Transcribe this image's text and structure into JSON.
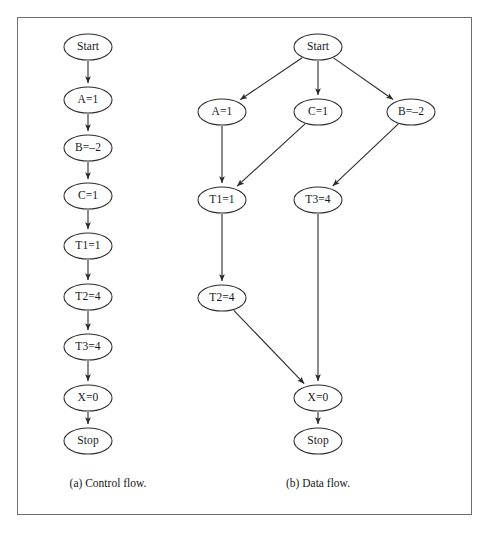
{
  "figure": {
    "frame": {
      "x": 17,
      "y": 17,
      "width": 455,
      "height": 498,
      "border_color": "#6f6f6f"
    },
    "ink_color": "#2b2b2b",
    "node_fill": "#ffffff",
    "text_color": "#15171a",
    "node_rx": 24,
    "node_ry": 13
  },
  "panels": [
    {
      "id": "control-flow",
      "caption": "(a) Control flow.",
      "caption_pos": {
        "x": 108,
        "y": 483
      },
      "type": "control-flow-graph",
      "nodes": [
        {
          "id": "a-start",
          "label": "Start",
          "x": 88,
          "y": 47
        },
        {
          "id": "a-a1",
          "label": "A=1",
          "x": 88,
          "y": 100
        },
        {
          "id": "a-b2",
          "label": "B=–2",
          "x": 88,
          "y": 148
        },
        {
          "id": "a-c1",
          "label": "C=1",
          "x": 88,
          "y": 196
        },
        {
          "id": "a-t11",
          "label": "T1=1",
          "x": 88,
          "y": 246
        },
        {
          "id": "a-t24",
          "label": "T2=4",
          "x": 88,
          "y": 297
        },
        {
          "id": "a-t34",
          "label": "T3=4",
          "x": 88,
          "y": 347
        },
        {
          "id": "a-x0",
          "label": "X=0",
          "x": 88,
          "y": 398
        },
        {
          "id": "a-stop",
          "label": "Stop",
          "x": 88,
          "y": 441
        }
      ],
      "edges": [
        {
          "from": "a-start",
          "to": "a-a1"
        },
        {
          "from": "a-a1",
          "to": "a-b2"
        },
        {
          "from": "a-b2",
          "to": "a-c1"
        },
        {
          "from": "a-c1",
          "to": "a-t11"
        },
        {
          "from": "a-t11",
          "to": "a-t24"
        },
        {
          "from": "a-t24",
          "to": "a-t34"
        },
        {
          "from": "a-t34",
          "to": "a-x0"
        },
        {
          "from": "a-x0",
          "to": "a-stop"
        }
      ]
    },
    {
      "id": "data-flow",
      "caption": "(b) Data flow.",
      "caption_pos": {
        "x": 318,
        "y": 483
      },
      "type": "data-flow-graph",
      "nodes": [
        {
          "id": "b-start",
          "label": "Start",
          "x": 318,
          "y": 47
        },
        {
          "id": "b-a1",
          "label": "A=1",
          "x": 222,
          "y": 112
        },
        {
          "id": "b-c1",
          "label": "C=1",
          "x": 318,
          "y": 112
        },
        {
          "id": "b-b2",
          "label": "B=–2",
          "x": 411,
          "y": 112
        },
        {
          "id": "b-t11",
          "label": "T1=1",
          "x": 222,
          "y": 200
        },
        {
          "id": "b-t34",
          "label": "T3=4",
          "x": 318,
          "y": 200
        },
        {
          "id": "b-t24",
          "label": "T2=4",
          "x": 222,
          "y": 298
        },
        {
          "id": "b-x0",
          "label": "X=0",
          "x": 318,
          "y": 398
        },
        {
          "id": "b-stop",
          "label": "Stop",
          "x": 318,
          "y": 441
        }
      ],
      "edges": [
        {
          "from": "b-start",
          "to": "b-a1"
        },
        {
          "from": "b-start",
          "to": "b-c1"
        },
        {
          "from": "b-start",
          "to": "b-b2"
        },
        {
          "from": "b-a1",
          "to": "b-t11"
        },
        {
          "from": "b-c1",
          "to": "b-t11"
        },
        {
          "from": "b-b2",
          "to": "b-t34"
        },
        {
          "from": "b-t11",
          "to": "b-t24"
        },
        {
          "from": "b-t24",
          "to": "b-x0"
        },
        {
          "from": "b-t34",
          "to": "b-x0"
        },
        {
          "from": "b-x0",
          "to": "b-stop"
        }
      ]
    }
  ]
}
